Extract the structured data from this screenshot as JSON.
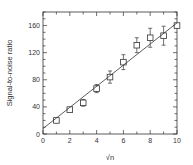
{
  "chart_data": {
    "type": "scatter",
    "title": "",
    "xlabel": "√n",
    "ylabel": "Signal-to-noise ratio",
    "xlim": [
      0,
      10
    ],
    "ylim": [
      0,
      180
    ],
    "xticks": [
      0,
      2,
      4,
      6,
      8,
      10
    ],
    "yticks": [
      0,
      40,
      80,
      120,
      160
    ],
    "x_minor_step": 1,
    "y_minor_step": 10,
    "grid": false,
    "legend": null,
    "series": [
      {
        "name": "measured",
        "marker": "open-square",
        "x": [
          1,
          2,
          3,
          4,
          5,
          6,
          7,
          8,
          9,
          10
        ],
        "y": [
          20,
          36,
          46,
          67,
          84,
          106,
          131,
          142,
          145,
          160
        ],
        "yerr": [
          2,
          2,
          5,
          6,
          9,
          11,
          11,
          14,
          14,
          3
        ]
      },
      {
        "name": "fit",
        "style": "line",
        "x": [
          0,
          10
        ],
        "y": [
          8,
          164
        ]
      }
    ]
  }
}
